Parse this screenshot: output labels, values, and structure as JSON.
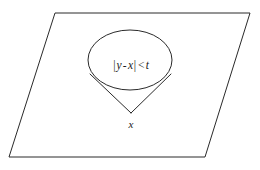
{
  "figure": {
    "kind": "geometric-diagram",
    "background_color": "#ffffff",
    "stroke_color": "#2a2a2a",
    "stroke_width": 1,
    "plane": {
      "name": "parallelogram-plane",
      "points": "55,13 250,13 205,157 9,157"
    },
    "ellipse": {
      "name": "cone-cross-section",
      "cx": 130,
      "cy": 60,
      "rx": 42,
      "ry": 30
    },
    "cone": {
      "name": "cone-outline",
      "apex_x": 131,
      "apex_y": 113,
      "left_tangent_x": 90,
      "left_tangent_y": 74,
      "right_tangent_x": 171,
      "right_tangent_y": 74
    },
    "labels": {
      "inequality": {
        "abs_open": "|",
        "y": "y",
        "minus": "-",
        "x": "x",
        "abs_close": "|",
        "less_than": "<",
        "t": "t",
        "full_text": "|y - x| < t"
      },
      "apex": "x"
    }
  }
}
